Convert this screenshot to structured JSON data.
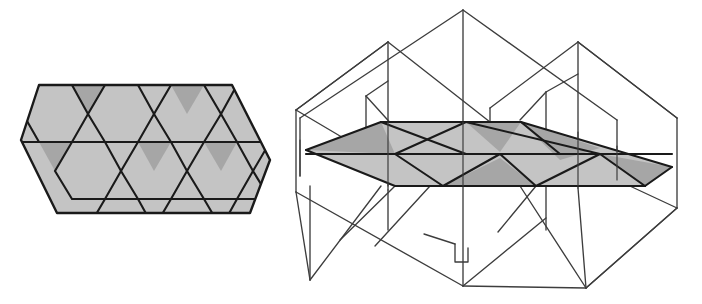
{
  "page": {
    "width": 702,
    "height": 304,
    "background": "#ffffff",
    "title": "Trihexagonal tiling patch and its 3D plane-arrangement realization",
    "figure_count": 2
  },
  "colors": {
    "background": "#ffffff",
    "fill_light": "#c4c4c4",
    "fill_dark": "#a6a6a6",
    "stroke_heavy": "#1a1a1a",
    "stroke_light": "#3d3d3d",
    "stroke_hidden": "#555555"
  },
  "strokes": {
    "heavy_width": 2.2,
    "medium_width": 1.6,
    "thin_width": 1.0
  },
  "figures": [
    {
      "id": "tiling-2d",
      "name": "planar-tiling-patch",
      "label": "",
      "description": "Shaded planar patch of a trihexagonal tiling shaped as a slanted parallelogram/hexagon outline",
      "geometry": {
        "outline": [
          [
            39,
            85
          ],
          [
            232,
            85
          ],
          [
            270,
            160
          ],
          [
            250,
            213
          ],
          [
            57,
            213
          ],
          [
            21,
            140
          ]
        ],
        "hex_radius": 38,
        "row_count": 2,
        "col_count": 3
      },
      "cells": {
        "hexagons": [
          {
            "name": "hex-r0-c0",
            "cx": 58,
            "cy": 117,
            "shade": "light"
          },
          {
            "name": "hex-r0-c1",
            "cx": 124,
            "cy": 117,
            "shade": "light"
          },
          {
            "name": "hex-r0-c2",
            "cx": 190,
            "cy": 117,
            "shade": "light"
          },
          {
            "name": "hex-r1-c0",
            "cx": 91,
            "cy": 174,
            "shade": "light"
          },
          {
            "name": "hex-r1-c1",
            "cx": 157,
            "cy": 174,
            "shade": "light"
          },
          {
            "name": "hex-r1-c2",
            "cx": 223,
            "cy": 174,
            "shade": "light"
          }
        ],
        "triangles_down": [
          {
            "name": "tri-down-r0-a",
            "shade": "dark"
          },
          {
            "name": "tri-down-r0-b",
            "shade": "dark"
          },
          {
            "name": "tri-down-r1-a",
            "shade": "dark"
          },
          {
            "name": "tri-down-r1-b",
            "shade": "dark"
          },
          {
            "name": "tri-down-r1-c",
            "shade": "dark"
          }
        ],
        "triangles_up": [
          {
            "name": "tri-up-r0-a",
            "shade": "light"
          },
          {
            "name": "tri-up-r0-b",
            "shade": "light"
          },
          {
            "name": "tri-up-r1-a",
            "shade": "light"
          },
          {
            "name": "tri-up-r1-b",
            "shade": "light"
          }
        ]
      }
    },
    {
      "id": "arrangement-3d",
      "name": "three-dimensional-plane-arrangement",
      "label": "",
      "description": "Wireframe perspective drawing of intersecting planes forming tent/prism shapes, with the horizontal trihexagonal cross-section shaded",
      "geometry": {
        "bounds": {
          "x": 285,
          "y": 8,
          "width": 410,
          "height": 290
        },
        "apex_top_center": [
          463,
          10
        ],
        "apex_top_left": [
          388,
          42
        ],
        "apex_top_right": [
          578,
          42
        ],
        "leftmost": [
          296,
          110
        ],
        "rightmost": [
          677,
          215
        ],
        "bottom_left": [
          310,
          280
        ],
        "bottom_right": [
          586,
          288
        ],
        "section_plane_y": 152
      },
      "shaded_section": {
        "name": "horizontal-cross-section",
        "outline": [
          [
            381,
            122
          ],
          [
            493,
            122
          ],
          [
            521,
            122
          ],
          [
            672,
            167
          ],
          [
            645,
            186
          ],
          [
            536,
            186
          ],
          [
            395,
            186
          ],
          [
            306,
            150
          ]
        ]
      }
    }
  ]
}
